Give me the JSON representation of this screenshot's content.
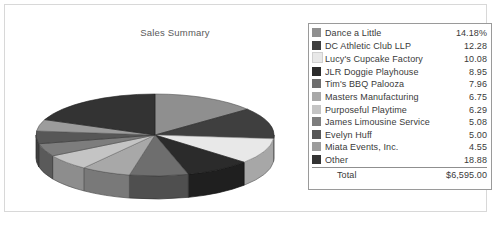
{
  "chart_title": "Sales Summary",
  "legend": {
    "total_label": "Total",
    "total_value": "$6,595.00"
  },
  "chart_data": {
    "type": "pie",
    "title": "Sales Summary",
    "unit": "percent",
    "total_label": "Total",
    "total_value": "$6,595.00",
    "categories": [
      "Dance a Little",
      "DC Athletic Club LLP",
      "Lucy's Cupcake Factory",
      "JLR Doggie Playhouse",
      "Tim's BBQ Palooza",
      "Masters Manufacturing",
      "Purposeful Playtime",
      "James Limousine Service",
      "Evelyn Huff",
      "Miata Events, Inc.",
      "Other"
    ],
    "values": [
      14.18,
      12.28,
      10.08,
      8.95,
      7.96,
      6.75,
      6.29,
      5.08,
      5.0,
      4.55,
      18.88
    ],
    "value_labels": [
      "14.18%",
      "12.28",
      "10.08",
      "8.95",
      "7.96",
      "6.75",
      "6.29",
      "5.08",
      "5.00",
      "4.55",
      "18.88"
    ],
    "colors": [
      "#8f8f8f",
      "#3f3f3f",
      "#e8e8e8",
      "#2b2b2b",
      "#6e6e6e",
      "#a8a8a8",
      "#c4c4c4",
      "#7d7d7d",
      "#575757",
      "#9c9c9c",
      "#333333"
    ],
    "legend_position": "right",
    "grid": false
  }
}
